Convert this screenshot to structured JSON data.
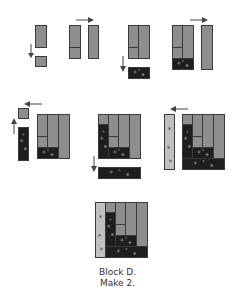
{
  "caption": {
    "line1": "Block D.",
    "line2": "Make 2."
  },
  "steps": [
    {
      "id": 1,
      "description": "Gray rectangle with small gray square sewn below",
      "arrow": "down"
    },
    {
      "id": 2,
      "description": "Unit from step 1 with tall gray strip added to right",
      "arrow": "right"
    },
    {
      "id": 3,
      "description": "Two-column unit with dark print strip added to bottom",
      "arrow": "down"
    },
    {
      "id": 4,
      "description": "Unit with tall gray strip added to right",
      "arrow": "right"
    },
    {
      "id": 5,
      "description": "Gray square sewn to dark print strip, then added to left",
      "arrow": "left"
    },
    {
      "id": 6,
      "description": "Square unit with dark print strip added to bottom",
      "arrow": "down"
    },
    {
      "id": 7,
      "description": "Light print strip added to left side",
      "arrow": "left"
    },
    {
      "id": 8,
      "description": "Finished Block D"
    }
  ],
  "colors": {
    "gray": "#8e8e8e",
    "dark_print": "#1e1e1e",
    "light_print": "#c0c0c0",
    "outline": "#3a3a3a"
  }
}
